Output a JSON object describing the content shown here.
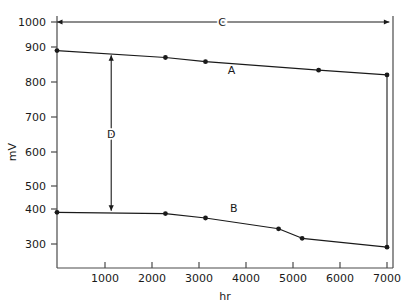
{
  "chart_data": {
    "type": "line",
    "title": "",
    "xlabel": "hr",
    "ylabel": "mV",
    "xlim": [
      0,
      7100
    ],
    "ylim": [
      250,
      1000
    ],
    "grid": false,
    "legend_position": "inline-labels",
    "xticks": [
      1000,
      2000,
      3000,
      4000,
      5000,
      6000,
      7000
    ],
    "xticklabels": [
      "1000",
      "2000",
      "3000",
      "4000",
      "5000",
      "6000",
      "7000"
    ],
    "yticks": [
      300,
      400,
      500,
      600,
      700,
      800,
      900,
      1000
    ],
    "yticklabels": [
      "300",
      "400",
      "500",
      "600",
      "700",
      "800",
      "900",
      "1000"
    ],
    "series": [
      {
        "name": "A",
        "label": "A",
        "label_x": 3700,
        "label_y": 835,
        "color": "#1a1a1a",
        "x": [
          0,
          2300,
          3150,
          5550,
          7000
        ],
        "y": [
          910,
          888,
          875,
          848,
          833
        ]
      },
      {
        "name": "B",
        "label": "B",
        "label_x": 3750,
        "label_y": 400,
        "color": "#1a1a1a",
        "x": [
          0,
          2300,
          3150,
          4700,
          5200,
          7000
        ],
        "y": [
          400,
          396,
          382,
          348,
          318,
          290
        ]
      }
    ],
    "annotations": [
      {
        "name": "C",
        "label": "C",
        "kind": "horizontal-double-arrow",
        "x_start": 0,
        "x_end": 7050,
        "y": 1000,
        "label_x": 3500,
        "label_y": 1000
      },
      {
        "name": "D",
        "label": "D",
        "kind": "vertical-double-arrow",
        "x": 1150,
        "y_start": 895,
        "y_end": 405,
        "label_x": 1150,
        "label_y": 648
      }
    ]
  }
}
